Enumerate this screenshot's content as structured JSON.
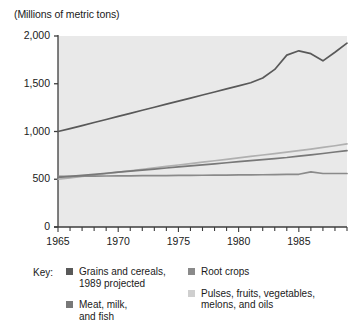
{
  "chart_data": {
    "type": "line",
    "title": "(Millions of metric tons)",
    "xlabel": "",
    "ylabel": "(Millions of metric tons)",
    "xlim": [
      1965,
      1989
    ],
    "ylim": [
      0,
      2000
    ],
    "yticks": [
      0,
      500,
      1000,
      1500,
      2000
    ],
    "ytick_labels": [
      "0",
      "500",
      "1,000",
      "1,500",
      "2,000"
    ],
    "xticks": [
      1965,
      1970,
      1975,
      1980,
      1985
    ],
    "xtick_labels": [
      "1965",
      "1970",
      "1975",
      "1980",
      "1985"
    ],
    "x_minor_tick_interval": 1,
    "grid": false,
    "legend_position": "below",
    "x": [
      1965,
      1966,
      1967,
      1968,
      1969,
      1970,
      1971,
      1972,
      1973,
      1974,
      1975,
      1976,
      1977,
      1978,
      1979,
      1980,
      1981,
      1982,
      1983,
      1984,
      1985,
      1986,
      1987,
      1988,
      1989
    ],
    "series": [
      {
        "name": "Grains and cereals, 1989 projected",
        "color": "#595959",
        "values": [
          1000,
          1030,
          1062,
          1094,
          1126,
          1158,
          1190,
          1222,
          1254,
          1286,
          1318,
          1350,
          1382,
          1414,
          1446,
          1478,
          1510,
          1560,
          1650,
          1800,
          1845,
          1815,
          1740,
          1830,
          1925
        ]
      },
      {
        "name": "Root crops",
        "color": "#8a8a8a",
        "values": [
          530,
          531,
          532,
          533,
          534,
          535,
          536,
          537,
          538,
          539,
          540,
          541,
          542,
          543,
          544,
          545,
          546,
          547,
          548,
          550,
          552,
          578,
          560,
          560,
          560
        ]
      },
      {
        "name": "Meat, milk, and fish",
        "color": "#787878",
        "values": [
          520,
          530,
          541,
          552,
          563,
          574,
          585,
          596,
          607,
          618,
          629,
          640,
          651,
          662,
          673,
          684,
          695,
          706,
          717,
          728,
          742,
          756,
          770,
          785,
          800
        ]
      },
      {
        "name": "Pulses, fruits, vegetables, melons, and oils",
        "color": "#b0b0b0",
        "values": [
          500,
          514,
          529,
          544,
          559,
          574,
          589,
          604,
          619,
          634,
          649,
          664,
          679,
          694,
          709,
          724,
          739,
          754,
          769,
          784,
          799,
          815,
          833,
          851,
          870
        ]
      }
    ]
  },
  "legend": {
    "key_label": "Key:",
    "entries": [
      {
        "label": "Grains and cereals,\n1989 projected",
        "color": "#595959",
        "column": "left"
      },
      {
        "label": "Meat, milk,\nand fish",
        "color": "#787878",
        "column": "left"
      },
      {
        "label": "Root crops",
        "color": "#8a8a8a",
        "column": "right"
      },
      {
        "label": "Pulses, fruits, vegetables,\nmelons, and oils",
        "color": "#cfcfcf",
        "column": "right"
      }
    ]
  },
  "plot_style": {
    "background": "#e9e9e9",
    "axis_color": "#3c3c3c",
    "page_background": "#ffffff"
  }
}
